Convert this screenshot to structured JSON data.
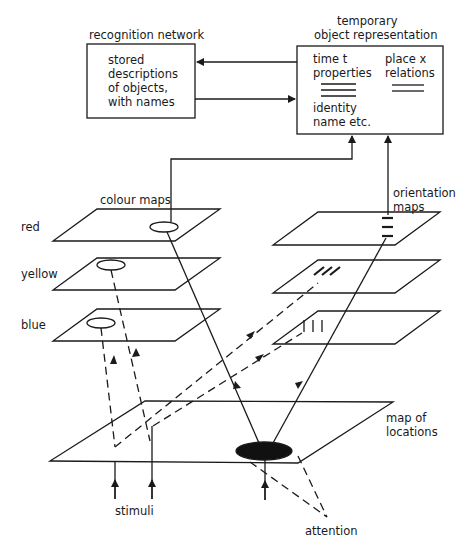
{
  "recognition": {
    "title": "recognition network",
    "lines": [
      "stored",
      "descriptions",
      "of objects,",
      "with names"
    ]
  },
  "temporary": {
    "title_line1": "temporary",
    "title_line2": "object representation",
    "time": "time t",
    "properties": "properties",
    "place": "place x",
    "relations": "relations",
    "identity": "identity",
    "name": "name etc."
  },
  "colour_maps": {
    "label": "colour maps",
    "red": "red",
    "yellow": "yellow",
    "blue": "blue"
  },
  "orientation_maps": {
    "label_line1": "orientation",
    "label_line2": "maps"
  },
  "location_map": {
    "label_line1": "map of",
    "label_line2": "locations"
  },
  "stimuli": "stimuli",
  "attention": "attention",
  "colors": {
    "ink": "#1a1a1a",
    "background": "#ffffff"
  }
}
